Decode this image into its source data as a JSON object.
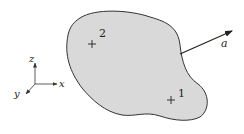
{
  "diagram": {
    "body": {
      "fill": "#d9d9d9",
      "stroke": "#333333"
    },
    "points": [
      {
        "label": "2",
        "marker": "+"
      },
      {
        "label": "1",
        "marker": "+"
      }
    ],
    "vector": {
      "label": "a"
    },
    "axes": {
      "z": "z",
      "x": "x",
      "y": "y"
    }
  }
}
